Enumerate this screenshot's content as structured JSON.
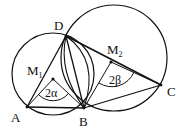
{
  "diagram": {
    "type": "geometry",
    "points": {
      "A": {
        "label": "A",
        "x": 27,
        "y": 107
      },
      "B": {
        "label": "B",
        "x": 84,
        "y": 108
      },
      "C": {
        "label": "C",
        "x": 161,
        "y": 85
      },
      "D": {
        "label": "D",
        "x": 66,
        "y": 35
      },
      "M1": {
        "label": "M",
        "sub": "1",
        "x": 53,
        "y": 79
      },
      "M2": {
        "label": "M",
        "sub": "2",
        "x": 111,
        "y": 62
      }
    },
    "circles": [
      {
        "name": "circle-M1",
        "cx": 53,
        "cy": 74,
        "r": 41
      },
      {
        "name": "circle-M2",
        "cx": 114,
        "cy": 58,
        "r": 53
      }
    ],
    "segments": [
      [
        "A",
        "B"
      ],
      [
        "A",
        "D"
      ],
      [
        "D",
        "B"
      ],
      [
        "D",
        "C"
      ],
      [
        "B",
        "C"
      ]
    ],
    "angles": {
      "alpha": {
        "label": "2α"
      },
      "beta": {
        "label": "2β"
      }
    }
  }
}
